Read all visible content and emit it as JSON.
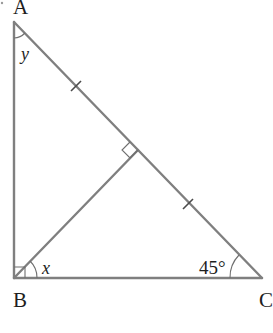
{
  "diagram": {
    "type": "geometry-right-triangle",
    "vertices": {
      "A": {
        "label": "A",
        "x": 14,
        "y": 22
      },
      "B": {
        "label": "B",
        "x": 14,
        "y": 278
      },
      "C": {
        "label": "C",
        "x": 262,
        "y": 278
      }
    },
    "foot_of_altitude": {
      "x": 138,
      "y": 150
    },
    "angles": {
      "at_A": {
        "label": "y"
      },
      "at_B_partial": {
        "label": "x"
      },
      "at_C": {
        "label": "45°",
        "value_deg": 45
      }
    },
    "right_angle_marks": [
      "B",
      "foot_of_altitude"
    ],
    "equal_segment_marks": [
      "A-D",
      "D-C"
    ],
    "colors": {
      "line": "#7f7f7f",
      "text": "#1e1e1e"
    }
  }
}
